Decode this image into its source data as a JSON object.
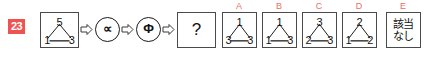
{
  "problem": {
    "number": "23"
  },
  "source_figure": {
    "label": "source-graph",
    "nodes": {
      "top": "5",
      "left": "1",
      "right": "3"
    }
  },
  "operators": [
    {
      "symbol": "∝",
      "name": "proportional-to"
    },
    {
      "symbol": "Φ",
      "name": "phi"
    }
  ],
  "arrows": [
    {
      "name": "arrow-1"
    },
    {
      "name": "arrow-2"
    },
    {
      "name": "arrow-3"
    }
  ],
  "question_cell": {
    "symbol": "?"
  },
  "options": [
    {
      "letter": "A",
      "type": "graph",
      "nodes": {
        "top": "1",
        "left": "3",
        "right": "3"
      }
    },
    {
      "letter": "B",
      "type": "graph",
      "nodes": {
        "top": "1",
        "left": "1",
        "right": "3"
      }
    },
    {
      "letter": "C",
      "type": "graph",
      "nodes": {
        "top": "3",
        "left": "2",
        "right": "3"
      }
    },
    {
      "letter": "D",
      "type": "graph",
      "nodes": {
        "top": "2",
        "left": "1",
        "right": "2"
      }
    },
    {
      "letter": "E",
      "type": "text",
      "text_line1": "該当",
      "text_line2": "なし"
    }
  ],
  "colors": {
    "badge_background": "#ef5350",
    "badge_text": "#ffffff",
    "option_label": "#e8705f",
    "frame_border": "#4a4a4a",
    "ink": "#111111"
  }
}
